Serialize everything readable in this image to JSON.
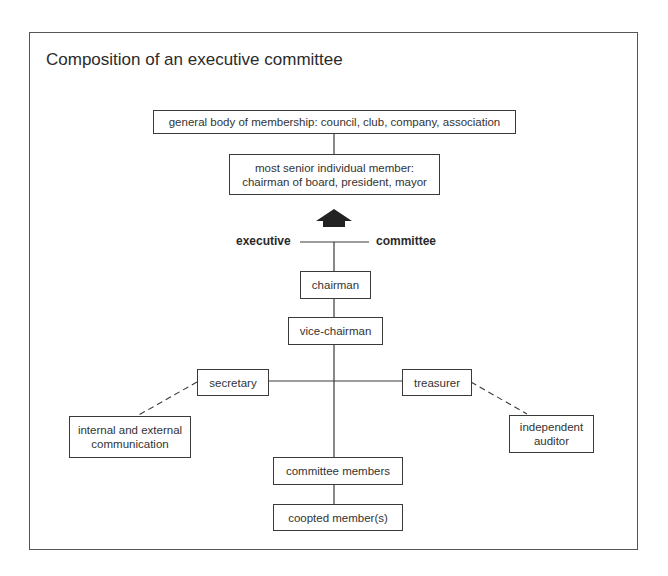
{
  "title": "Composition of an executive committee",
  "nodes": {
    "general_body": "general body of membership: council, club, company, association",
    "senior_member_line1": "most senior individual member:",
    "senior_member_line2": "chairman of board, president, mayor",
    "chairman": "chairman",
    "vice_chairman": "vice-chairman",
    "secretary": "secretary",
    "treasurer": "treasurer",
    "communication_line1": "internal and external",
    "communication_line2": "communication",
    "auditor_line1": "independent",
    "auditor_line2": "auditor",
    "committee_members": "committee members",
    "coopted_members": "coopted member(s)"
  },
  "labels": {
    "executive": "executive",
    "committee": "committee"
  },
  "icons": {
    "upward_arrow": "up-arrow-icon"
  },
  "colors": {
    "line": "#3a3a3a",
    "arrow": "#222222",
    "background": "#ffffff"
  }
}
